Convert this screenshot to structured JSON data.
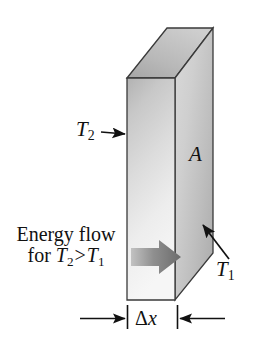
{
  "figure": {
    "background_color": "#ffffff",
    "width": 258,
    "height": 343
  },
  "labels": {
    "t2": "T",
    "t2_sub": "2",
    "t1": "T",
    "t1_sub": "1",
    "area": "A",
    "thickness_delta": "Δ",
    "thickness_var": "x",
    "energy_line1": "Energy flow",
    "energy_line2_prefix": "for ",
    "energy_line2_t2": "T",
    "energy_line2_t2_sub": "2",
    "energy_line2_gt": ">",
    "energy_line2_t1": "T",
    "energy_line2_t1_sub": "1"
  },
  "icons": {
    "t2_pointer": "arrow-right-icon",
    "t1_pointer": "arrow-up-left-icon",
    "energy_flow": "block-arrow-right-icon",
    "dimension_left": "dimension-arrow-right-icon",
    "dimension_right": "dimension-arrow-left-icon",
    "slab": "rectangular-prism-icon"
  },
  "colors": {
    "outline": "#2b2b2b",
    "front_face_light": "#f2f2f2",
    "front_face_dark": "#b9b9b9",
    "right_face_light": "#e2e2e2",
    "right_face_dark": "#a8a8a8",
    "top_face_light": "#d2d2d2",
    "top_face_dark": "#9a9a9a",
    "flow_arrow_light": "#b5b5b5",
    "flow_arrow_dark": "#6d6d6d",
    "text": "#111111"
  },
  "geometry": {
    "front_face": "127,78 175,78 175,300 127,300",
    "right_face": "175,78 213,28 213,253 175,300",
    "top_face": "127,78 167,28 213,28 175,78",
    "dimension_left_tick_x": 127,
    "dimension_right_tick_x": 177,
    "dimension_line_y": 320
  }
}
